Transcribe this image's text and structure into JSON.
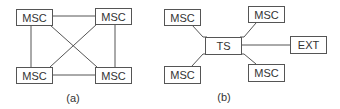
{
  "diagram_a": {
    "caption": "(a)",
    "nodes": [
      {
        "id": "a-tl",
        "label": "MSC"
      },
      {
        "id": "a-tr",
        "label": "MSC"
      },
      {
        "id": "a-bl",
        "label": "MSC"
      },
      {
        "id": "a-br",
        "label": "MSC"
      }
    ],
    "edges": [
      [
        "a-tl",
        "a-tr"
      ],
      [
        "a-tl",
        "a-bl"
      ],
      [
        "a-tl",
        "a-br"
      ],
      [
        "a-tr",
        "a-br"
      ],
      [
        "a-tr",
        "a-bl"
      ],
      [
        "a-bl",
        "a-br"
      ]
    ]
  },
  "diagram_b": {
    "caption": "(b)",
    "nodes": [
      {
        "id": "b-tl",
        "label": "MSC"
      },
      {
        "id": "b-tr",
        "label": "MSC"
      },
      {
        "id": "b-ts",
        "label": "TS"
      },
      {
        "id": "b-ext",
        "label": "EXT"
      },
      {
        "id": "b-bl",
        "label": "MSC"
      },
      {
        "id": "b-br",
        "label": "MSC"
      }
    ],
    "edges": [
      [
        "b-tl",
        "b-ts"
      ],
      [
        "b-tr",
        "b-ts"
      ],
      [
        "b-bl",
        "b-ts"
      ],
      [
        "b-br",
        "b-ts"
      ],
      [
        "b-ts",
        "b-ext"
      ]
    ]
  }
}
